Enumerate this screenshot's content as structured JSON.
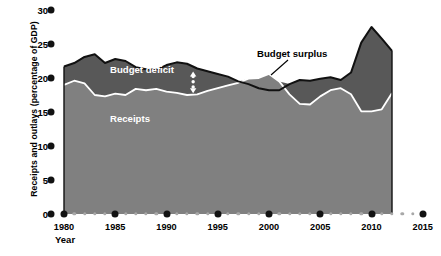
{
  "chart_data": {
    "type": "area",
    "title": "",
    "subtitle": "",
    "xlabel": "Year",
    "ylabel": "Receipts and outlays (percentage of GDP)",
    "xlim": [
      1979,
      2015
    ],
    "ylim": [
      0,
      30
    ],
    "xticks": [
      1980,
      1985,
      1990,
      1995,
      2000,
      2005,
      2010,
      2015
    ],
    "xtick_labels": [
      "1980",
      "1985",
      "1990",
      "1995",
      "2000",
      "2005",
      "2010",
      "2015"
    ],
    "xminor_step": 1,
    "yticks": [
      0,
      5,
      10,
      15,
      20,
      25,
      30
    ],
    "ytick_labels": [
      "0",
      "5",
      "10",
      "15",
      "20",
      "25",
      "30"
    ],
    "grid": false,
    "legend_position": "in-plot-annotations",
    "x": [
      1980,
      1981,
      1982,
      1983,
      1984,
      1985,
      1986,
      1987,
      1988,
      1989,
      1990,
      1991,
      1992,
      1993,
      1994,
      1995,
      1996,
      1997,
      1998,
      1999,
      2000,
      2001,
      2002,
      2003,
      2004,
      2005,
      2006,
      2007,
      2008,
      2009,
      2010,
      2011,
      2012
    ],
    "series": [
      {
        "name": "Outlays",
        "color": "#585858",
        "values": [
          21.7,
          22.2,
          23.1,
          23.5,
          22.2,
          22.8,
          22.5,
          21.6,
          21.3,
          21.2,
          21.9,
          22.3,
          22.1,
          21.4,
          21.0,
          20.6,
          20.2,
          19.5,
          19.1,
          18.5,
          18.2,
          18.2,
          19.1,
          19.7,
          19.6,
          19.9,
          20.1,
          19.7,
          20.8,
          25.2,
          27.5,
          25.8,
          24.0
        ]
      },
      {
        "name": "Receipts",
        "color": "#808080",
        "values": [
          19.0,
          19.6,
          19.2,
          17.5,
          17.3,
          17.7,
          17.5,
          18.4,
          18.2,
          18.4,
          18.0,
          17.8,
          17.5,
          17.6,
          18.1,
          18.5,
          18.9,
          19.3,
          19.9,
          20.0,
          20.6,
          19.5,
          17.6,
          16.2,
          16.1,
          17.3,
          18.2,
          18.5,
          17.6,
          15.1,
          15.1,
          15.4,
          17.8
        ]
      }
    ],
    "annotations": [
      {
        "name": "outlays-label",
        "text": "Outlays",
        "color": "#ffffff"
      },
      {
        "name": "budget-deficit-label",
        "text": "Budget deficit",
        "color": "#ffffff"
      },
      {
        "name": "receipts-label",
        "text": "Receipts",
        "color": "#ffffff"
      },
      {
        "name": "budget-surplus-label",
        "text": "Budget surplus",
        "color": "#000000"
      }
    ],
    "colors": {
      "outlays_band": "#585858",
      "receipts_band": "#808080",
      "boundary_line": "#ffffff",
      "outline": "#111111",
      "axis_dot_major": "#121212",
      "axis_dot_minor": "#a8a8a8",
      "background": "#ffffff"
    }
  },
  "axes": {
    "y_title": "Receipts and outlays (percentage of GDP)",
    "x_title": "Year"
  },
  "labels": {
    "outlays": "Outlays",
    "budget_deficit": "Budget deficit",
    "receipts": "Receipts",
    "budget_surplus": "Budget surplus"
  }
}
